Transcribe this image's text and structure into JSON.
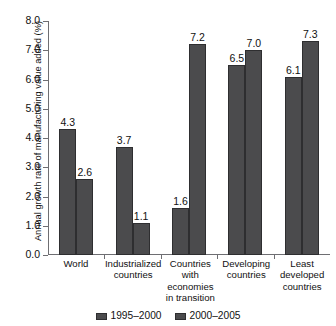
{
  "caption_sliver": {
    "text": "       ",
    "note": "cut-off caption at top edge, illegible"
  },
  "chart_data": {
    "type": "bar",
    "title": "",
    "xlabel": "",
    "ylabel": "Annual growth rate of manufacturing value added (%)",
    "ylim": [
      0.0,
      8.0
    ],
    "ytick_labels": [
      "8.0",
      "7.0",
      "6.0",
      "5.0",
      "4.0",
      "3.0",
      "2.0",
      "1.0",
      "0.0"
    ],
    "yticks": [
      8.0,
      7.0,
      6.0,
      5.0,
      4.0,
      3.0,
      2.0,
      1.0,
      0.0
    ],
    "grid": false,
    "legend_position": "bottom-center",
    "categories": [
      "World",
      "Industrialized countries",
      "Countries with economies in transition",
      "Developing countries",
      "Least developed countries"
    ],
    "series": [
      {
        "name": "1995–2000",
        "color": "#4b4b4d",
        "values": [
          4.3,
          3.7,
          1.6,
          6.5,
          6.1
        ],
        "labels": [
          "4.3",
          "3.7",
          "1.6",
          "6.5",
          "6.1"
        ]
      },
      {
        "name": "2000–2005",
        "color": "#4b4b4d",
        "values": [
          2.6,
          1.1,
          7.2,
          7.0,
          7.3
        ],
        "labels": [
          "2.6",
          "1.1",
          "7.2",
          "7.0",
          "7.3"
        ]
      }
    ]
  },
  "axis": {
    "y_title": "Annual growth rate of manufacturing value added (%)"
  },
  "legend": {
    "items": [
      {
        "label": "1995–2000",
        "color": "#4b4b4d"
      },
      {
        "label": "2000–2005",
        "color": "#4b4b4d"
      }
    ]
  }
}
